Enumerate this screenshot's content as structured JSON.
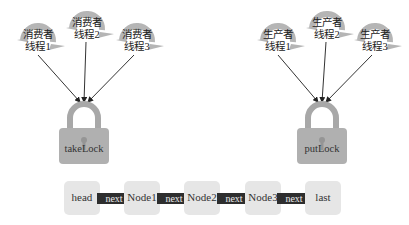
{
  "consumers": [
    {
      "label_line1": "消费者",
      "label_line2": "线程1"
    },
    {
      "label_line1": "消费者",
      "label_line2": "线程2"
    },
    {
      "label_line1": "消费者",
      "label_line2": "线程3"
    }
  ],
  "producers": [
    {
      "label_line1": "生产者",
      "label_line2": "线程1"
    },
    {
      "label_line1": "生产者",
      "label_line2": "线程2"
    },
    {
      "label_line1": "生产者",
      "label_line2": "线程3"
    }
  ],
  "locks": {
    "take": {
      "label": "takeLock"
    },
    "put": {
      "label": "putLock"
    }
  },
  "list": {
    "nodes": [
      {
        "label": "head"
      },
      {
        "label": "Node1"
      },
      {
        "label": "Node2"
      },
      {
        "label": "Node3"
      },
      {
        "label": "last"
      }
    ],
    "link_label": "next"
  },
  "colors": {
    "thread_swirl": "#b5b5b5",
    "lock_body": "#b0b0b0",
    "node_fill": "#e6e6e6",
    "arrow_fill": "#2e2e2e",
    "line": "#333333"
  }
}
